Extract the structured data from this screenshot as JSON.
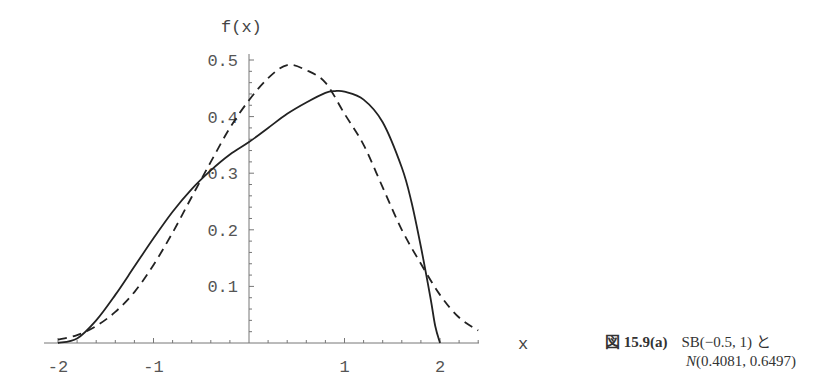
{
  "chart_data": {
    "type": "line",
    "title": "",
    "xlabel": "x",
    "ylabel": "f(x)",
    "xlim": [
      -2.05,
      2.45
    ],
    "ylim": [
      0,
      0.5
    ],
    "grid": false,
    "x_ticks": [
      "-2",
      "-1",
      "1",
      "2"
    ],
    "y_ticks": [
      "0.1",
      "0.2",
      "0.3",
      "0.4",
      "0.5"
    ],
    "series": [
      {
        "name": "SB(-0.5, 1)",
        "style": "solid",
        "x": [
          -2.0,
          -1.8,
          -1.6,
          -1.4,
          -1.2,
          -1.0,
          -0.8,
          -0.6,
          -0.4,
          -0.2,
          0.0,
          0.2,
          0.4,
          0.6,
          0.8,
          0.9,
          1.0,
          1.2,
          1.4,
          1.6,
          1.7,
          1.8,
          1.9,
          1.95,
          2.0
        ],
        "values": [
          0.0,
          0.008,
          0.04,
          0.085,
          0.135,
          0.185,
          0.232,
          0.272,
          0.305,
          0.333,
          0.355,
          0.38,
          0.405,
          0.425,
          0.442,
          0.445,
          0.444,
          0.43,
          0.39,
          0.31,
          0.25,
          0.17,
          0.08,
          0.03,
          0.0
        ]
      },
      {
        "name": "N(0.4081, 0.6497)",
        "style": "dashed",
        "x": [
          -2.0,
          -1.8,
          -1.6,
          -1.4,
          -1.2,
          -1.0,
          -0.8,
          -0.6,
          -0.4,
          -0.2,
          0.0,
          0.2,
          0.4,
          0.6,
          0.8,
          1.0,
          1.2,
          1.4,
          1.6,
          1.8,
          2.0,
          2.2,
          2.4
        ],
        "values": [
          0.006,
          0.014,
          0.03,
          0.055,
          0.09,
          0.138,
          0.195,
          0.258,
          0.32,
          0.38,
          0.429,
          0.468,
          0.491,
          0.482,
          0.46,
          0.405,
          0.35,
          0.275,
          0.2,
          0.14,
          0.085,
          0.045,
          0.022
        ]
      }
    ],
    "legend": "none",
    "caption": {
      "figure_label": "図 15.9(a)",
      "line1": "SB(−0.5, 1) と",
      "line2_dist": "N",
      "line2_params": "(0.4081, 0.6497)"
    }
  }
}
